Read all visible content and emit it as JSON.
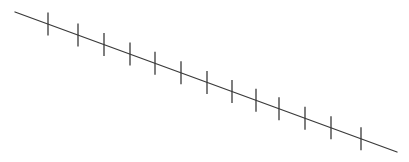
{
  "diagram": {
    "type": "tick-marked-line",
    "background": "#ffffff",
    "stroke_color": "#3a3a3a",
    "line": {
      "x1": 15,
      "y1": 12,
      "x2": 397,
      "y2": 152,
      "stroke_width": 1.3
    },
    "ticks": {
      "half_length": 11.5,
      "stroke_width": 1.3,
      "x_positions": [
        48,
        78,
        104,
        130,
        155,
        181,
        207,
        232,
        256,
        279,
        305,
        331,
        361
      ]
    }
  }
}
